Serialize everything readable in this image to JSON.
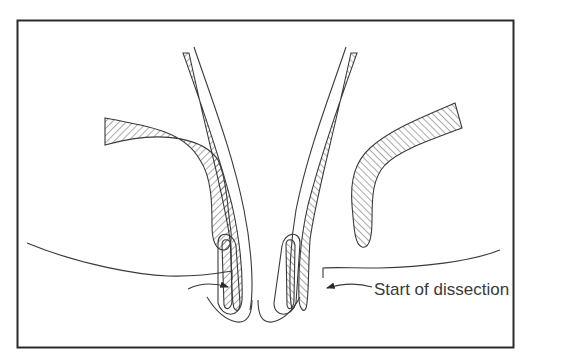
{
  "figure": {
    "type": "anatomical-schematic",
    "frame": {
      "stroke": "#2a2a2a"
    },
    "colors": {
      "line": "#3a3a3a",
      "hatch": "#555555",
      "background": "#ffffff"
    },
    "annotations": [
      {
        "id": "start-of-dissection",
        "text": "Start of dissection",
        "pointer": "arrow-left"
      }
    ],
    "arrows": [
      {
        "id": "left-dissection-arrow",
        "direction": "right"
      },
      {
        "id": "right-dissection-arrow",
        "direction": "left"
      }
    ]
  }
}
